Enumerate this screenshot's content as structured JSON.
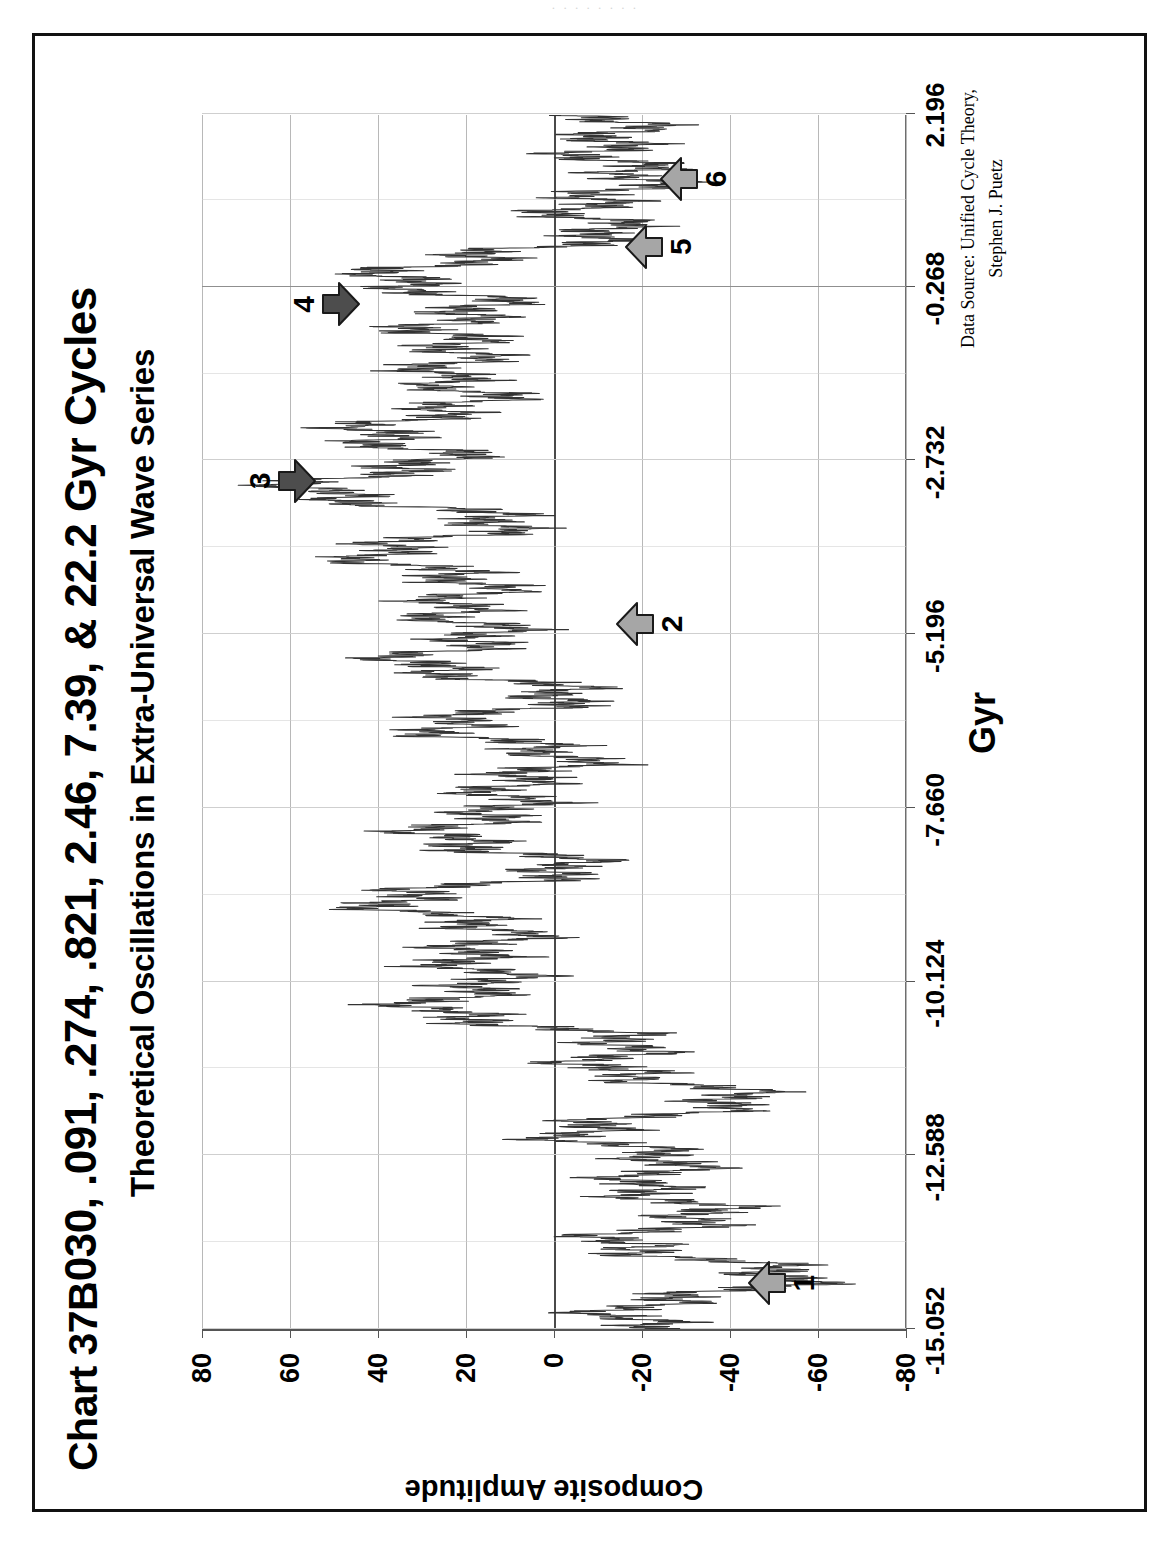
{
  "page": {
    "scan_artifact_text": "· · · · · · · ·",
    "border_color": "#111111",
    "background": "#ffffff"
  },
  "header": {
    "chart_number": "Chart 37B",
    "title": ".030, .091, .274, .821, 2.46, 7.39, & 22.2 Gyr Cycles",
    "subtitle": "Theoretical Oscillations in Extra-Universal Wave Series"
  },
  "notes": {
    "data_source_line1": "Data Source:  Unified Cycle Theory,",
    "data_source_line2": "Stephen J. Puetz"
  },
  "chart_data": {
    "type": "line",
    "title": ".030, .091, .274, .821, 2.46, 7.39, & 22.2 Gyr Cycles",
    "subtitle": "Theoretical Oscillations in Extra-Universal Wave Series",
    "xlabel": "Gyr",
    "ylabel": "Composite Amplitude",
    "xlim": [
      -15.052,
      2.196
    ],
    "ylim": [
      -80,
      80
    ],
    "xticks": [
      -15.052,
      -12.588,
      -10.124,
      -7.66,
      -5.196,
      -2.732,
      -0.268,
      2.196
    ],
    "xtick_labels": [
      "-15.052",
      "-12.588",
      "-10.124",
      "-7.660",
      "-5.196",
      "-2.732",
      "-0.268",
      "2.196"
    ],
    "yticks": [
      80,
      60,
      40,
      20,
      0,
      -20,
      -40,
      -60,
      -80
    ],
    "ytick_labels": [
      "80",
      "60",
      "40",
      "20",
      "0",
      "-20",
      "-40",
      "-60",
      "-80"
    ],
    "grid": "both",
    "legend": "none",
    "series_name": "Composite Amplitude",
    "series_color": "#333333",
    "cycles_gyr": [
      0.03,
      0.091,
      0.274,
      0.821,
      2.46,
      7.39,
      22.2
    ],
    "envelope_description": "Dense high-frequency oscillation whose composite envelope swings from about -45 near -14.4 Gyr up to about +35 near -9 Gyr, down to -35 near -11.5 Gyr, up to a peak of about +50 near -3.0 Gyr, and decays toward 0 approaching 2.196 Gyr",
    "envelope_control_points": [
      {
        "x": -15.052,
        "y": -10
      },
      {
        "x": -14.4,
        "y": -46
      },
      {
        "x": -13.7,
        "y": -22
      },
      {
        "x": -13.1,
        "y": -30
      },
      {
        "x": -12.4,
        "y": -12
      },
      {
        "x": -11.7,
        "y": -34
      },
      {
        "x": -11.0,
        "y": -8
      },
      {
        "x": -10.3,
        "y": 26
      },
      {
        "x": -9.7,
        "y": 10
      },
      {
        "x": -9.1,
        "y": 30
      },
      {
        "x": -8.4,
        "y": 4
      },
      {
        "x": -7.8,
        "y": 24
      },
      {
        "x": -7.2,
        "y": -2
      },
      {
        "x": -6.6,
        "y": 16
      },
      {
        "x": -6.0,
        "y": 6
      },
      {
        "x": -5.4,
        "y": 28
      },
      {
        "x": -4.8,
        "y": 14
      },
      {
        "x": -4.2,
        "y": 34
      },
      {
        "x": -3.6,
        "y": 20
      },
      {
        "x": -3.0,
        "y": 50
      },
      {
        "x": -2.55,
        "y": 28
      },
      {
        "x": -2.1,
        "y": 36
      },
      {
        "x": -1.6,
        "y": 14
      },
      {
        "x": -1.1,
        "y": 30
      },
      {
        "x": -0.6,
        "y": 10
      },
      {
        "x": -0.2,
        "y": 42
      },
      {
        "x": 0.2,
        "y": 8
      },
      {
        "x": 0.6,
        "y": -6
      },
      {
        "x": 1.0,
        "y": -18
      },
      {
        "x": 1.4,
        "y": -10
      },
      {
        "x": 1.8,
        "y": -22
      },
      {
        "x": 2.196,
        "y": -4
      }
    ]
  },
  "annotations": [
    {
      "id": "1",
      "label": "1",
      "x": -14.4,
      "y": -52,
      "direction": "up",
      "shade": "light"
    },
    {
      "id": "2",
      "label": "2",
      "x": -5.05,
      "y": -22,
      "direction": "up",
      "shade": "light"
    },
    {
      "id": "3",
      "label": "3",
      "x": -3.02,
      "y": 62,
      "direction": "down",
      "shade": "dark"
    },
    {
      "id": "4",
      "label": "4",
      "x": -0.52,
      "y": 52,
      "direction": "down",
      "shade": "dark"
    },
    {
      "id": "5",
      "label": "5",
      "x": 0.3,
      "y": -24,
      "direction": "up",
      "shade": "light"
    },
    {
      "id": "6",
      "label": "6",
      "x": 1.26,
      "y": -32,
      "direction": "up",
      "shade": "light"
    }
  ],
  "colors": {
    "arrow_light_fill": "#a6a6a6",
    "arrow_dark_fill": "#4d4d4d",
    "arrow_stroke": "#1a1a1a",
    "gridline": "#c8c8c8",
    "axis": "#555555",
    "zero_line": "#4a4a4a"
  }
}
